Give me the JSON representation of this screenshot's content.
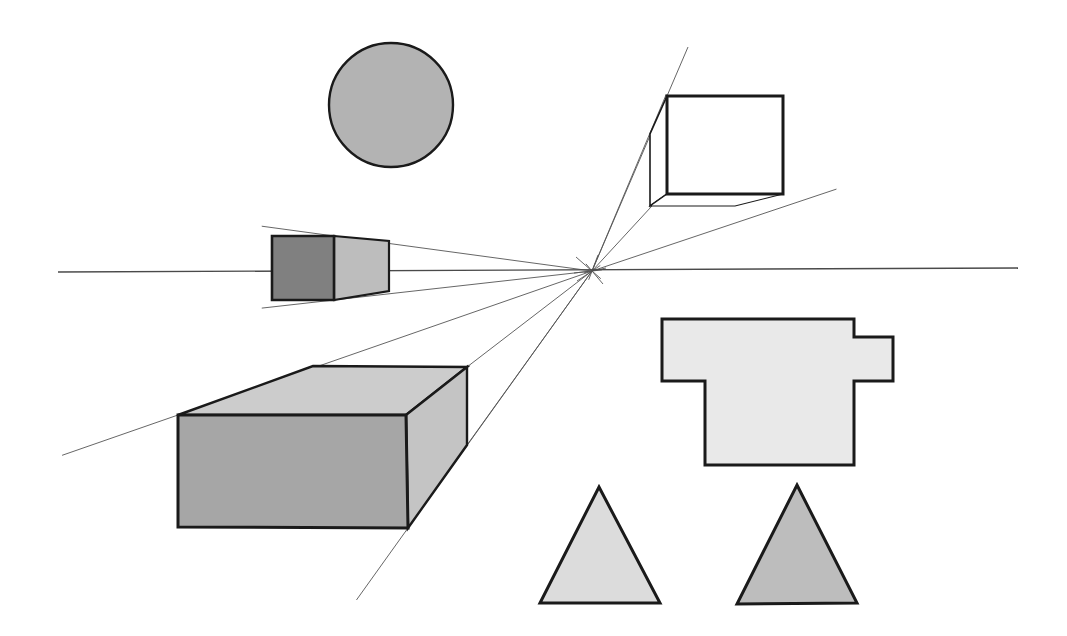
{
  "document": {
    "title": "One-Point Perspective Shapes Diagram",
    "width": 1067,
    "height": 636,
    "background_color": "#ffffff",
    "description": "Technical line drawing showing several flat and three-dimensional shapes arranged around a single vanishing point on a horizon line."
  },
  "palette": {
    "outline": "#1a1a1a",
    "thin_line": "#555555",
    "horizon_line": "#4a4a4a",
    "circle_fill": "#b3b3b3",
    "cube_front_fill": "#ffffff",
    "cube_side_fill": "#ffffff",
    "frustum_front_fill": "#808080",
    "frustum_side_fill": "#bdbdbd",
    "bigbox_front_fill": "#a6a6a6",
    "bigbox_top_fill": "#cccccc",
    "bigbox_side_fill": "#c4c4c4",
    "tshape_fill": "#e9e9e9",
    "triangle_left_fill": "#dcdcdc",
    "triangle_right_fill": "#bdbdbd"
  },
  "geometry": {
    "vanishing_point": {
      "x": 592,
      "y": 271,
      "label": "vanishing point"
    },
    "horizon": {
      "x1": 58,
      "y1": 272,
      "x2": 1018,
      "y2": 268,
      "label": "horizon line"
    },
    "circle": {
      "cx": 391,
      "cy": 105,
      "r": 62
    },
    "cube": {
      "front_face": "667,96 783,96 783,194 667,194",
      "top_face": "667,96 650,134 633,134 651,96",
      "left_face": "667,96 650,134 650,206 667,194",
      "bottom_face": "667,194 650,206 735,206 783,194"
    },
    "frustum": {
      "front_face": "272,236 334,236 334,300 272,300",
      "side_face": "334,236 389,241 389,291 334,300"
    },
    "big_box": {
      "front_face": "178,415 406,415 408,528 178,527",
      "top_face": "178,415 313,366 467,367 406,415",
      "right_face": "406,415 467,367 467,445 408,528"
    },
    "t_shape": "662,319 854,319 854,337 893,337 893,381 854,381 854,465 705,465 705,381 662,381",
    "triangle_left": "599,487 660,603 540,603",
    "triangle_right": "797,485 857,603 737,604",
    "perspective_rays": [
      {
        "name": "ray-to-cube-top-left",
        "x2": 667,
        "y2": 96
      },
      {
        "name": "ray-to-cube-back-top",
        "x2": 650,
        "y2": 133
      },
      {
        "name": "ray-to-cube-bottom-left",
        "x2": 651,
        "y2": 207
      },
      {
        "name": "ray-to-cube-bottom-right",
        "x2": 783,
        "y2": 207
      },
      {
        "name": "ray-to-frustum-top",
        "x2": 334,
        "y2": 236
      },
      {
        "name": "ray-to-frustum-bottom",
        "x2": 334,
        "y2": 300
      },
      {
        "name": "ray-to-bigbox-top-back-left",
        "x2": 178,
        "y2": 415
      },
      {
        "name": "ray-to-bigbox-top-back-right",
        "x2": 467,
        "y2": 367
      },
      {
        "name": "ray-to-bigbox-side-bottom",
        "x2": 467,
        "y2": 445
      },
      {
        "name": "ray-to-bigbox-front-bottom",
        "x2": 408,
        "y2": 528
      }
    ]
  },
  "shapes": [
    {
      "id": "circle",
      "name": "shaded circle",
      "type": "circle",
      "fill": "#b3b3b3"
    },
    {
      "id": "cube",
      "name": "white cube in perspective",
      "type": "cube",
      "fill": "#ffffff"
    },
    {
      "id": "frustum",
      "name": "small dark box in perspective",
      "type": "box",
      "fill": "#808080"
    },
    {
      "id": "big-box",
      "name": "large rectangular prism",
      "type": "box",
      "fill": "#a6a6a6"
    },
    {
      "id": "t-shape",
      "name": "notched t-shaped polygon",
      "type": "polygon",
      "fill": "#e9e9e9"
    },
    {
      "id": "triangle-left",
      "name": "light triangle",
      "type": "triangle",
      "fill": "#dcdcdc"
    },
    {
      "id": "triangle-right",
      "name": "medium triangle",
      "type": "triangle",
      "fill": "#bdbdbd"
    }
  ]
}
